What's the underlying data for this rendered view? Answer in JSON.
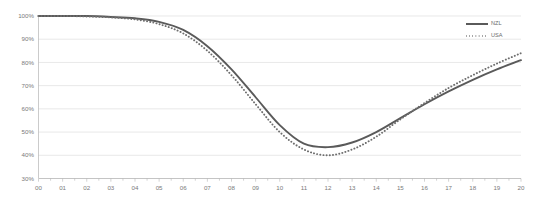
{
  "chart_data": {
    "type": "line",
    "title": "",
    "subtitle": "",
    "xlabel": "",
    "ylabel": "",
    "grid": true,
    "legend_position": "top-right",
    "xlim": [
      0,
      20
    ],
    "ylim": [
      30,
      100
    ],
    "y_tick_labels": [
      "100%",
      "90%",
      "80%",
      "70%",
      "60%",
      "50%",
      "40%",
      "30%"
    ],
    "y_tick_values": [
      100,
      90,
      80,
      70,
      60,
      50,
      40,
      30
    ],
    "x": [
      0,
      1,
      2,
      3,
      4,
      5,
      6,
      7,
      8,
      9,
      10,
      11,
      12,
      13,
      14,
      15,
      16,
      17,
      18,
      19,
      20
    ],
    "x_tick_labels": [
      "00",
      "01",
      "02",
      "03",
      "04",
      "05",
      "06",
      "07",
      "08",
      "09",
      "10",
      "11",
      "12",
      "13",
      "14",
      "15",
      "16",
      "17",
      "18",
      "19",
      "20"
    ],
    "series": [
      {
        "name": "NZL",
        "style": "solid",
        "color": "#5a5a5a",
        "values": [
          100,
          100,
          100,
          99.6,
          99,
          97.5,
          94,
          87,
          77,
          65,
          53,
          45,
          43.5,
          45.5,
          50,
          56,
          62,
          67.5,
          72.5,
          77,
          81
        ]
      },
      {
        "name": "USA",
        "style": "dotted",
        "color": "#6e6e6e",
        "values": [
          100,
          100,
          99.8,
          99.4,
          98.5,
          96.5,
          92.5,
          85,
          74.5,
          62,
          50,
          42.5,
          40,
          42.5,
          48,
          55.5,
          62.5,
          69,
          74.5,
          79.5,
          84
        ]
      }
    ]
  },
  "legend": {
    "items": [
      {
        "label": "NZL",
        "style": "solid"
      },
      {
        "label": "USA",
        "style": "dotted"
      }
    ]
  }
}
